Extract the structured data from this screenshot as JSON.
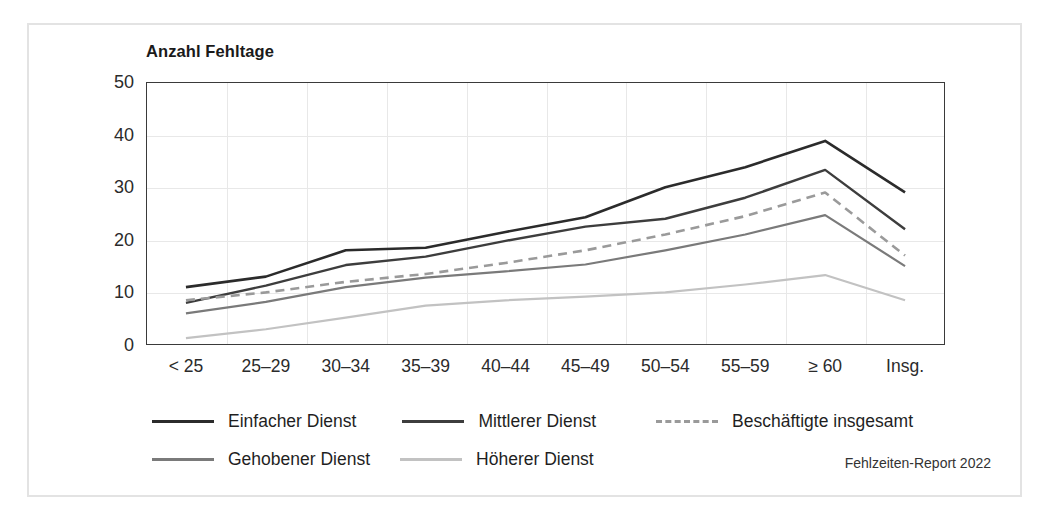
{
  "figure": {
    "axis_title": "Anzahl Fehltage",
    "source_note": "Fehlzeiten-Report 2022"
  },
  "chart_data": {
    "type": "line",
    "title": "Anzahl Fehltage",
    "xlabel": "",
    "ylabel": "Anzahl Fehltage",
    "ylim": [
      0,
      50
    ],
    "yticks": [
      0,
      10,
      20,
      30,
      40,
      50
    ],
    "grid": true,
    "legend_position": "below",
    "categories": [
      "< 25",
      "25–29",
      "30–34",
      "35–39",
      "40–44",
      "45–49",
      "50–54",
      "55–59",
      "≥ 60",
      "Insg."
    ],
    "series": [
      {
        "name": "Einfacher Dienst",
        "color": "#2b2b2b",
        "style": "solid",
        "width": 2.6,
        "values": [
          11.0,
          13.0,
          18.0,
          18.5,
          21.5,
          24.3,
          30.0,
          33.8,
          38.8,
          29.0
        ]
      },
      {
        "name": "Mittlerer Dienst",
        "color": "#3d3d3d",
        "style": "solid",
        "width": 2.4,
        "values": [
          8.0,
          11.3,
          15.2,
          16.8,
          19.8,
          22.5,
          24.0,
          28.0,
          33.3,
          22.0
        ]
      },
      {
        "name": "Beschäftigte insgesamt",
        "color": "#9a9a9a",
        "style": "dashed",
        "width": 2.6,
        "values": [
          8.5,
          10.0,
          12.0,
          13.5,
          15.6,
          18.0,
          21.0,
          24.5,
          29.0,
          17.0
        ]
      },
      {
        "name": "Gehobener Dienst",
        "color": "#7a7a7a",
        "style": "solid",
        "width": 2.2,
        "values": [
          6.0,
          8.2,
          11.0,
          12.8,
          14.0,
          15.3,
          18.0,
          21.0,
          24.7,
          15.0
        ]
      },
      {
        "name": "Höherer Dienst",
        "color": "#c2c2c2",
        "style": "solid",
        "width": 2.2,
        "values": [
          1.3,
          3.0,
          5.2,
          7.5,
          8.5,
          9.2,
          10.0,
          11.5,
          13.3,
          8.5
        ]
      }
    ],
    "legend": [
      {
        "label": "Einfacher Dienst",
        "color": "#2b2b2b",
        "style": "solid"
      },
      {
        "label": "Mittlerer Dienst",
        "color": "#3d3d3d",
        "style": "solid"
      },
      {
        "label": "Beschäftigte insgesamt",
        "color": "#9a9a9a",
        "style": "dashed"
      },
      {
        "label": "Gehobener Dienst",
        "color": "#7a7a7a",
        "style": "solid"
      },
      {
        "label": "Höherer Dienst",
        "color": "#c2c2c2",
        "style": "solid"
      }
    ]
  }
}
